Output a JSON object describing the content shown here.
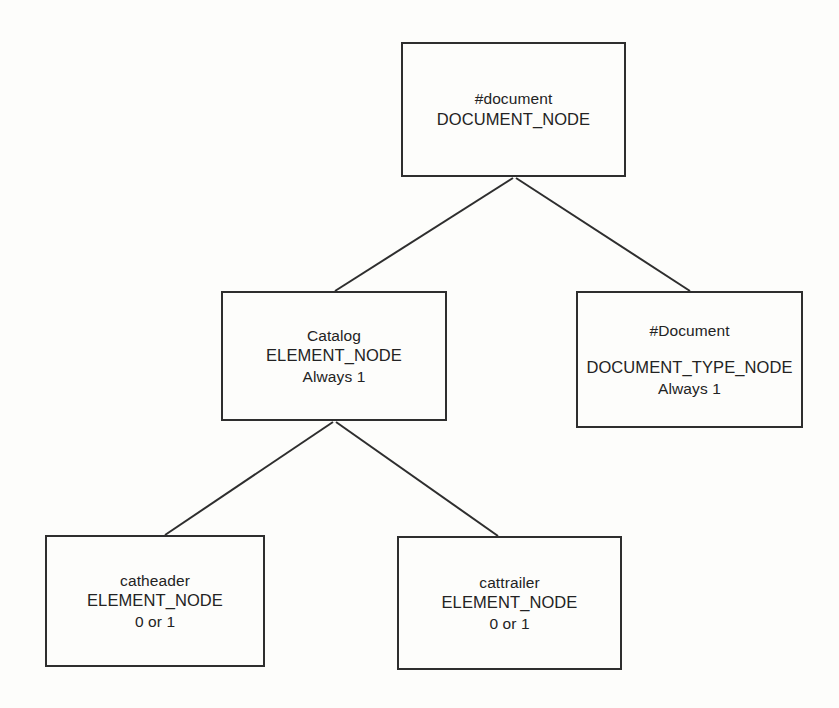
{
  "diagram": {
    "background_color": "#fdfdfb",
    "stroke_color": "#2e2e2e",
    "text_color": "#232323",
    "nodes": [
      {
        "id": "document",
        "name": "#document",
        "type": "DOCUMENT_NODE",
        "cardinality": "",
        "gap_after_name": false
      },
      {
        "id": "catalog",
        "name": "Catalog",
        "type": "ELEMENT_NODE",
        "cardinality": "Always 1",
        "gap_after_name": false
      },
      {
        "id": "doctype",
        "name": "#Document",
        "type": "DOCUMENT_TYPE_NODE",
        "cardinality": "Always 1",
        "gap_after_name": true
      },
      {
        "id": "catheader",
        "name": "catheader",
        "type": "ELEMENT_NODE",
        "cardinality": "0 or 1",
        "gap_after_name": false
      },
      {
        "id": "cattrailer",
        "name": "cattrailer",
        "type": "ELEMENT_NODE",
        "cardinality": "0 or 1",
        "gap_after_name": false
      }
    ],
    "edges": [
      {
        "id": "document-to-catalog",
        "from": "document",
        "to": "catalog",
        "x1": 513,
        "y1": 178,
        "x2": 335,
        "y2": 291
      },
      {
        "id": "document-to-doctype",
        "from": "document",
        "to": "doctype",
        "x1": 516,
        "y1": 178,
        "x2": 690,
        "y2": 291
      },
      {
        "id": "catalog-to-catheader",
        "from": "catalog",
        "to": "catheader",
        "x1": 333,
        "y1": 422,
        "x2": 165,
        "y2": 535
      },
      {
        "id": "catalog-to-cattrailer",
        "from": "catalog",
        "to": "cattrailer",
        "x1": 336,
        "y1": 422,
        "x2": 498,
        "y2": 536
      }
    ]
  }
}
